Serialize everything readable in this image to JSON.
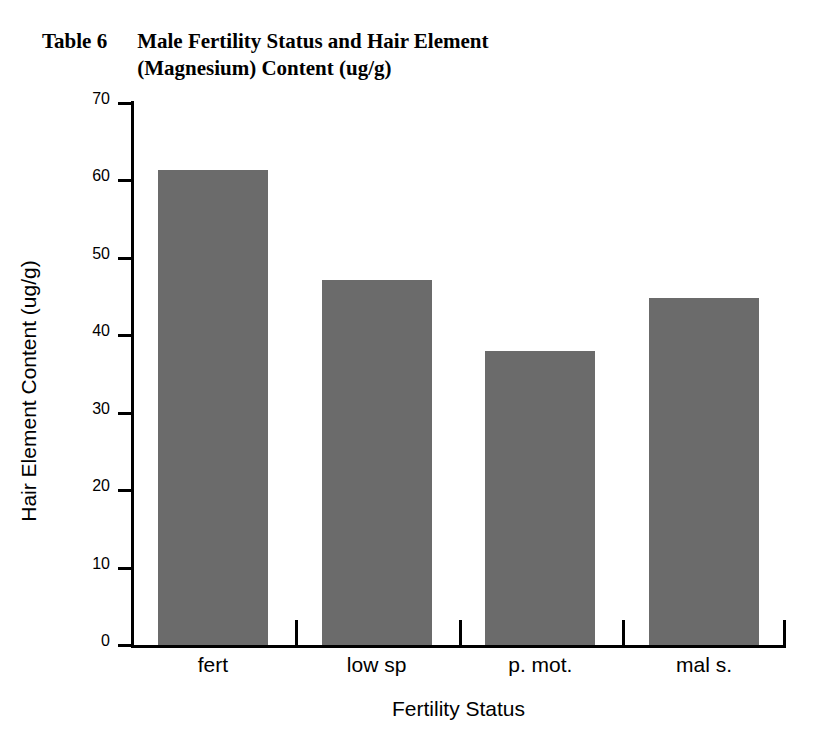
{
  "title": {
    "table_number": "Table 6",
    "text": "Male Fertility Status and Hair Element (Magnesium) Content (ug/g)"
  },
  "chart_data": {
    "type": "bar",
    "title": "Male Fertility Status and Hair Element (Magnesium) Content (ug/g)",
    "categories": [
      "fert",
      "low sp",
      "p. mot.",
      "mal s."
    ],
    "values": [
      61.3,
      47.2,
      38.0,
      44.8
    ],
    "xlabel": "Fertility Status",
    "ylabel": "Hair Element Content (ug/g)",
    "ylim": [
      0,
      70
    ],
    "ytick_labels": [
      "0",
      "10",
      "20",
      "30",
      "40",
      "50",
      "60",
      "70"
    ],
    "ytick_values": [
      0,
      10,
      20,
      30,
      40,
      50,
      60,
      70
    ],
    "grid": false,
    "legend": "none",
    "bar_color": "#6b6b6b",
    "axis_color": "#000000"
  }
}
